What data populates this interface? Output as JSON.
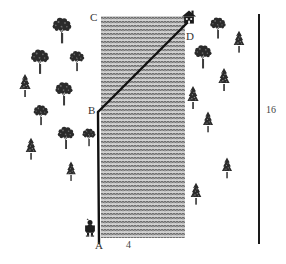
{
  "diagram": {
    "colors": {
      "path_line": "#111111",
      "river_fill": "#b9b9b9",
      "river_wave": "#5a5a5a",
      "tree_dark": "#2b2b2b",
      "tree_mid": "#555555",
      "label_text": "#333333",
      "scale_bar": "#1a1a1a",
      "background": "#ffffff"
    },
    "vertices": [
      {
        "id": "A",
        "label": "A",
        "x": 99,
        "y": 243,
        "note": "bottom of path, at person's position on near bank"
      },
      {
        "id": "B",
        "label": "B",
        "x": 90,
        "y": 111,
        "note": "bend point where vertical path turns diagonal"
      },
      {
        "id": "C",
        "label": "C",
        "x": 90,
        "y": 17,
        "note": "top-left corner of the river band"
      },
      {
        "id": "D",
        "label": "D",
        "x": 188,
        "y": 37,
        "note": "house on the far bank"
      }
    ],
    "measurements": [
      {
        "id": "river-width",
        "label": "4",
        "x": 128,
        "y": 241,
        "note": "width of the river band"
      },
      {
        "id": "scale-length",
        "label": "16",
        "x": 266,
        "y": 110,
        "note": "length of the vertical scale bar at right"
      }
    ],
    "river": {
      "left_x": 101,
      "right_x": 185,
      "top_y": 16,
      "bottom_y": 238,
      "pattern": "wavy-water-hatch"
    },
    "path": {
      "segments": [
        {
          "from": "A",
          "to": "B",
          "kind": "vertical"
        },
        {
          "from": "B",
          "to": "D",
          "kind": "diagonal"
        }
      ]
    },
    "scale_bar": {
      "x": 259,
      "y_top": 14,
      "y_bottom": 244
    },
    "figures": [
      {
        "id": "person",
        "name": "person-figure",
        "x": 90,
        "y": 222
      },
      {
        "id": "house",
        "name": "house-figure",
        "x": 189,
        "y": 16
      }
    ],
    "trees": {
      "left_bank": [
        {
          "type": "deciduous",
          "x": 62,
          "y": 33,
          "s": 1.15
        },
        {
          "type": "deciduous",
          "x": 40,
          "y": 64,
          "s": 1.1
        },
        {
          "type": "deciduous",
          "x": 77,
          "y": 63,
          "s": 0.9
        },
        {
          "type": "conifer",
          "x": 25,
          "y": 90,
          "s": 1.0
        },
        {
          "type": "deciduous",
          "x": 64,
          "y": 96,
          "s": 1.05
        },
        {
          "type": "deciduous",
          "x": 41,
          "y": 117,
          "s": 0.9
        },
        {
          "type": "deciduous",
          "x": 66,
          "y": 140,
          "s": 1.0
        },
        {
          "type": "deciduous",
          "x": 89,
          "y": 139,
          "s": 0.8
        },
        {
          "type": "conifer",
          "x": 31,
          "y": 153,
          "s": 0.95
        },
        {
          "type": "conifer",
          "x": 71,
          "y": 175,
          "s": 0.85
        }
      ],
      "right_bank": [
        {
          "type": "deciduous",
          "x": 218,
          "y": 30,
          "s": 0.95
        },
        {
          "type": "conifer",
          "x": 239,
          "y": 46,
          "s": 0.95
        },
        {
          "type": "deciduous",
          "x": 203,
          "y": 59,
          "s": 1.05
        },
        {
          "type": "conifer",
          "x": 224,
          "y": 84,
          "s": 1.0
        },
        {
          "type": "conifer",
          "x": 193,
          "y": 102,
          "s": 1.0
        },
        {
          "type": "conifer",
          "x": 208,
          "y": 126,
          "s": 0.9
        },
        {
          "type": "conifer",
          "x": 227,
          "y": 172,
          "s": 0.9
        },
        {
          "type": "conifer",
          "x": 196,
          "y": 198,
          "s": 0.95
        }
      ]
    }
  }
}
